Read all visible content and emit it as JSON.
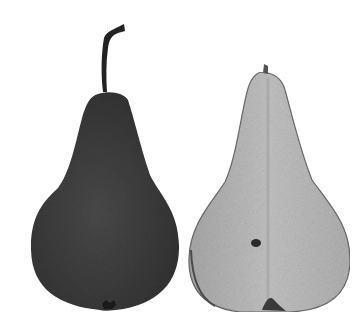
{
  "image": {
    "description": "Grayscale photograph of two pears: a whole dark pear with stem on the left and a halved pear showing its pale flesh on the right",
    "background_color": "#ffffff",
    "subjects": [
      {
        "name": "whole-pear",
        "color": "#3f3f3f",
        "has_stem": true
      },
      {
        "name": "halved-pear",
        "color": "#b9b9b9",
        "has_core_spot": true
      }
    ]
  }
}
